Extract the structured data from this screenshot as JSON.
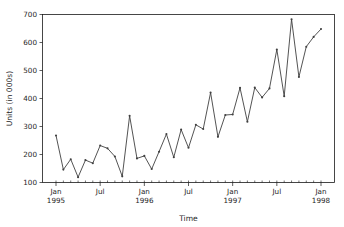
{
  "figure": {
    "background_color": "#ffffff",
    "axes_color": "#1a1a1a",
    "text_color": "#262626"
  },
  "chart_data": {
    "type": "line",
    "title": "",
    "xlabel": "Time",
    "ylabel": "Units (in 000s)",
    "line_color": "#404040",
    "marker": "point",
    "marker_color": "#404040",
    "grid": false,
    "legend": false,
    "ylim": [
      100,
      700
    ],
    "ytick_labels": [
      "100",
      "200",
      "300",
      "400",
      "500",
      "600",
      "700"
    ],
    "ytick_values": [
      100,
      200,
      300,
      400,
      500,
      600,
      700
    ],
    "xtick_labels": [
      "Jan\n1995",
      "Jul",
      "Jan\n1996",
      "Jul",
      "Jan\n1997",
      "Jul",
      "Jan\n1998"
    ],
    "xtick_label_lines": [
      [
        "Jan",
        "1995"
      ],
      [
        "Jul",
        ""
      ],
      [
        "Jan",
        "1996"
      ],
      [
        "Jul",
        ""
      ],
      [
        "Jan",
        "1997"
      ],
      [
        "Jul",
        ""
      ],
      [
        "Jan",
        "1998"
      ]
    ],
    "xtick_months": [
      "1995-01",
      "1995-07",
      "1996-01",
      "1996-07",
      "1997-01",
      "1997-07",
      "1998-01"
    ],
    "x": [
      "1995-01",
      "1995-02",
      "1995-03",
      "1995-04",
      "1995-05",
      "1995-06",
      "1995-07",
      "1995-08",
      "1995-09",
      "1995-10",
      "1995-11",
      "1995-12",
      "1996-01",
      "1996-02",
      "1996-03",
      "1996-04",
      "1996-05",
      "1996-06",
      "1996-07",
      "1996-08",
      "1996-09",
      "1996-10",
      "1996-11",
      "1996-12",
      "1997-01",
      "1997-02",
      "1997-03",
      "1997-04",
      "1997-05",
      "1997-06",
      "1997-07",
      "1997-08",
      "1997-09",
      "1997-10",
      "1997-11",
      "1997-12",
      "1998-01"
    ],
    "values": [
      268,
      146,
      183,
      119,
      180,
      169,
      232,
      222,
      193,
      122,
      338,
      186,
      195,
      148,
      210,
      273,
      190,
      289,
      224,
      306,
      291,
      421,
      263,
      341,
      343,
      438,
      317,
      439,
      404,
      436,
      575,
      408,
      683,
      477,
      585,
      620,
      648
    ]
  }
}
